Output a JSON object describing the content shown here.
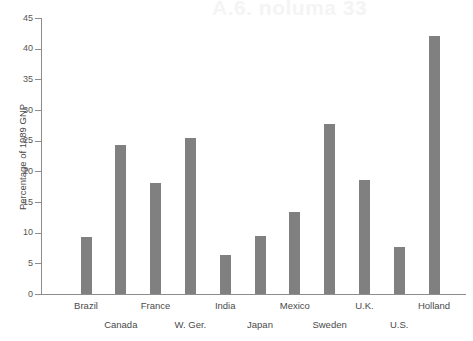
{
  "ghost": {
    "headline": "A.6. noluma 33",
    "subline": ""
  },
  "chart_data": {
    "type": "bar",
    "title": "",
    "xlabel": "",
    "ylabel": "Percentage of 1989 GNP",
    "ylim": [
      0,
      45
    ],
    "ytick_step": 5,
    "grid": false,
    "legend": "none",
    "bar_color": "#808080",
    "axis_color": "#8d8d8d",
    "background": "#ffffff",
    "label_stagger": true,
    "categories": [
      "Brazil",
      "Canada",
      "France",
      "W. Ger.",
      "India",
      "Japan",
      "Mexico",
      "Sweden",
      "U.K.",
      "U.S.",
      "Holland"
    ],
    "values": [
      9.3,
      24.3,
      18.1,
      25.5,
      6.4,
      9.4,
      13.4,
      27.8,
      18.6,
      7.6,
      42.1
    ],
    "ytick_labels": [
      "0",
      "5",
      "10",
      "15",
      "20",
      "25",
      "30",
      "35",
      "40",
      "45"
    ],
    "ytick_values": [
      0,
      5,
      10,
      15,
      20,
      25,
      30,
      35,
      40,
      45
    ]
  }
}
